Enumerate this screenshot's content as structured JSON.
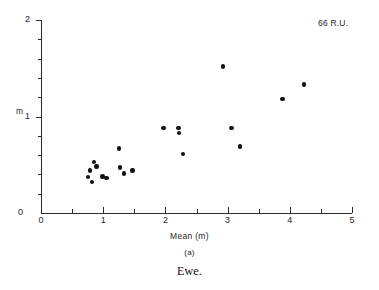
{
  "chart_data": {
    "type": "scatter",
    "title": "",
    "subfigure_label": "(a)",
    "caption": "Ewe.",
    "annotation": "66 R.U.",
    "xlabel": "Mean (m)",
    "ylabel": "m",
    "xlim": [
      0,
      5
    ],
    "ylim": [
      0,
      2
    ],
    "grid": false,
    "legend": null,
    "x_ticks": [
      0,
      1,
      2,
      3,
      4,
      5
    ],
    "x_tick_labels": [
      "0",
      "1",
      "2",
      "3",
      "4",
      "5"
    ],
    "x_minor_ticks": [
      0.5,
      1.5,
      2.5,
      3.5,
      4.5
    ],
    "y_ticks": [
      0,
      1,
      2
    ],
    "y_tick_labels": [
      "0",
      "1",
      "2"
    ],
    "y_minor_ticks": [
      0.2,
      0.4,
      0.6,
      0.8,
      1.2,
      1.4,
      1.6,
      1.8
    ],
    "marker": "filled-circle",
    "marker_color": "#111111",
    "points": [
      {
        "x": 0.76,
        "y": 0.37
      },
      {
        "x": 0.79,
        "y": 0.44
      },
      {
        "x": 0.82,
        "y": 0.32
      },
      {
        "x": 0.85,
        "y": 0.53
      },
      {
        "x": 0.89,
        "y": 0.48
      },
      {
        "x": 0.99,
        "y": 0.38
      },
      {
        "x": 1.05,
        "y": 0.36
      },
      {
        "x": 1.25,
        "y": 0.67
      },
      {
        "x": 1.27,
        "y": 0.47
      },
      {
        "x": 1.33,
        "y": 0.41
      },
      {
        "x": 1.47,
        "y": 0.44
      },
      {
        "x": 1.97,
        "y": 0.88
      },
      {
        "x": 2.21,
        "y": 0.88
      },
      {
        "x": 2.22,
        "y": 0.83
      },
      {
        "x": 2.28,
        "y": 0.61
      },
      {
        "x": 2.93,
        "y": 1.52
      },
      {
        "x": 3.06,
        "y": 0.88
      },
      {
        "x": 3.2,
        "y": 0.69
      },
      {
        "x": 3.88,
        "y": 1.18
      },
      {
        "x": 4.23,
        "y": 1.33
      }
    ]
  }
}
